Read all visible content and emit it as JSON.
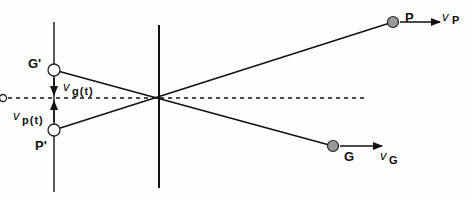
{
  "diagram": {
    "labels": {
      "P": "P",
      "G": "G",
      "P_prime": "P'",
      "G_prime": "G'",
      "O": "O",
      "vP_v": "v",
      "vP_sub": "P",
      "vG_v": "v",
      "vG_sub": "G",
      "vg_v": "v",
      "vg_sub": "g(t)",
      "vp_v": "v",
      "vp_sub": "p(t)"
    },
    "colors": {
      "line": "#111111",
      "object_fill": "#9a9a9a",
      "image_fill": "#ffffff"
    },
    "geometry": {
      "lens_x": 159,
      "image_plane_x": 54,
      "axis_y": 98,
      "P": [
        393,
        22
      ],
      "G": [
        333,
        146
      ],
      "P_prime": [
        54,
        130
      ],
      "G_prime": [
        54,
        70
      ]
    }
  }
}
